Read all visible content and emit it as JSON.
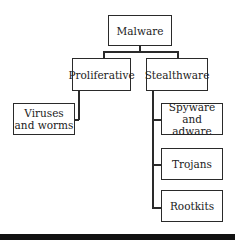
{
  "diagram": {
    "root": {
      "label": "Malware"
    },
    "branches": [
      {
        "label": "Proliferative",
        "children": [
          {
            "label": "Viruses and worms"
          }
        ]
      },
      {
        "label": "Stealthware",
        "children": [
          {
            "label": "Spyware and adware"
          },
          {
            "label": "Trojans"
          },
          {
            "label": "Rootkits"
          }
        ]
      }
    ]
  },
  "colors": {
    "line": "#2a2a2a",
    "background": "#ffffff",
    "bottom_bar": "#111111"
  }
}
